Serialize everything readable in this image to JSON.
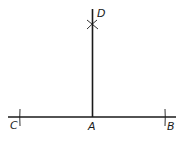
{
  "diagram": {
    "type": "geometric-construction",
    "colors": {
      "stroke": "#1a1a1a",
      "background": "#ffffff"
    },
    "points": [
      {
        "id": "C",
        "label": "C"
      },
      {
        "id": "A",
        "label": "A"
      },
      {
        "id": "B",
        "label": "B"
      },
      {
        "id": "D",
        "label": "D"
      }
    ],
    "segments": [
      {
        "from": "C",
        "to": "B",
        "name": "base-line"
      },
      {
        "from": "A",
        "to": "D",
        "name": "perpendicular"
      }
    ],
    "marks": [
      {
        "at": "C",
        "kind": "arc-tick"
      },
      {
        "at": "B",
        "kind": "arc-tick"
      },
      {
        "at": "D",
        "kind": "arc-intersection-cross"
      }
    ]
  }
}
